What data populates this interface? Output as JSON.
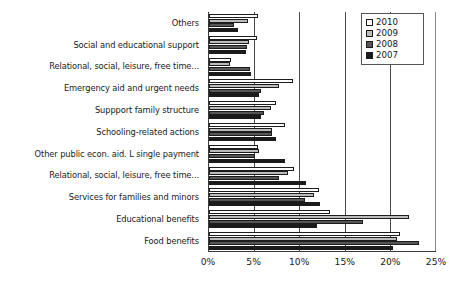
{
  "chart_data": {
    "type": "bar",
    "orientation": "horizontal",
    "title": "",
    "xlabel": "",
    "ylabel": "",
    "xlim": [
      0,
      25
    ],
    "xunit": "%",
    "xticks": [
      0,
      5,
      10,
      15,
      20,
      25
    ],
    "xtick_labels": [
      "0%",
      "5%",
      "10%",
      "15%",
      "20%",
      "25%"
    ],
    "grid": true,
    "grid_axis": "x",
    "legend_position": "top-right",
    "categories": [
      "Others",
      "Social and educational support",
      "Relational, social, leisure, free time...",
      "Emergency aid and urgent needs",
      "Suppport family structure",
      "Schooling-related actions",
      "Other public econ. aid. L single payment",
      "Relational, social, leisure, free time...",
      "Services for families and minors",
      "Educational benefits",
      "Food benefits"
    ],
    "series": [
      {
        "name": "2010",
        "color": "#ffffff",
        "values": [
          5.4,
          5.3,
          2.4,
          9.3,
          7.4,
          8.4,
          5.4,
          9.4,
          12.2,
          13.4,
          21.1
        ]
      },
      {
        "name": "2009",
        "color": "#bcbcbc",
        "values": [
          4.3,
          4.4,
          2.3,
          7.7,
          6.9,
          7.0,
          5.5,
          8.7,
          11.6,
          22.1,
          20.8
        ]
      },
      {
        "name": "2008",
        "color": "#565656",
        "values": [
          2.8,
          4.2,
          4.5,
          5.7,
          6.1,
          7.0,
          5.1,
          7.7,
          10.6,
          17.0,
          23.2
        ]
      },
      {
        "name": "2007",
        "color": "#1a1a1a",
        "values": [
          3.2,
          4.1,
          4.6,
          5.5,
          5.7,
          7.4,
          8.4,
          10.7,
          12.3,
          11.9,
          20.4
        ]
      }
    ]
  },
  "legend": {
    "items": [
      {
        "label": "2010",
        "color": "#ffffff"
      },
      {
        "label": "2009",
        "color": "#bcbcbc"
      },
      {
        "label": "2008",
        "color": "#565656"
      },
      {
        "label": "2007",
        "color": "#1a1a1a"
      }
    ]
  }
}
